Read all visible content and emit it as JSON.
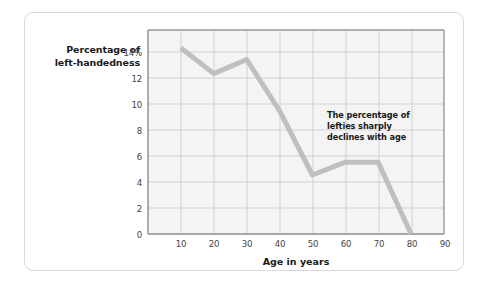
{
  "card": {
    "background": "#ffffff",
    "border_color": "#d9d9d9"
  },
  "chart_data": {
    "type": "line",
    "title": "",
    "xlabel": "Age in years",
    "ylabel": "Percentage of left-handedness",
    "ylabel_lines": [
      "Percentage of",
      "left-handedness"
    ],
    "x": [
      10,
      20,
      30,
      40,
      50,
      60,
      70,
      80
    ],
    "values": [
      14.5,
      12.5,
      13.6,
      9.6,
      4.6,
      5.6,
      5.6,
      0
    ],
    "series": [
      {
        "name": "Percentage of left-handedness",
        "values": [
          14.5,
          12.5,
          13.6,
          9.6,
          4.6,
          5.6,
          5.6,
          0
        ]
      }
    ],
    "xlim": [
      0,
      90
    ],
    "ylim": [
      0,
      15.9
    ],
    "xticks": [
      10,
      20,
      30,
      40,
      50,
      60,
      70,
      80,
      90
    ],
    "xtick_labels": [
      "10",
      "20",
      "30",
      "40",
      "50",
      "60",
      "70",
      "80",
      "90"
    ],
    "yticks": [
      0,
      2,
      4,
      6,
      8,
      10,
      12,
      14
    ],
    "ytick_labels": [
      "0",
      "2",
      "4",
      "6",
      "8",
      "10",
      "12",
      "14%"
    ],
    "grid": true,
    "legend": "none",
    "line_color": "#bfbfbf",
    "line_width": 5,
    "plot_background": "#f4f4f4",
    "grid_color": "#c9c9c9",
    "axis_color": "#8c8c8c",
    "annotations": [
      {
        "lines": [
          "The percentage of",
          "lefties sharply",
          "declines with age"
        ],
        "text": "The percentage of lefties sharply declines with age",
        "x": 58,
        "y": 9.5
      }
    ]
  }
}
